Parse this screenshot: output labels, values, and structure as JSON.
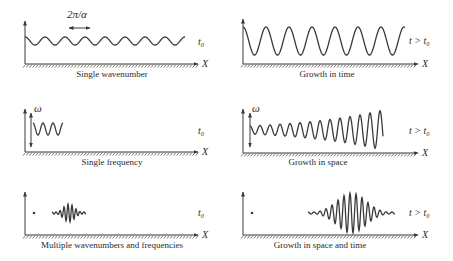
{
  "figure": {
    "panels": [
      {
        "id": "single-wavenumber",
        "caption": "Single wavenumber",
        "time_label": "t₀",
        "axis_label": "X",
        "annotation": "2π/α",
        "wave": {
          "type": "sinusoid",
          "x_start": 25,
          "x_end": 185,
          "center_y": 41,
          "amplitude": 4,
          "period": 20
        }
      },
      {
        "id": "growth-in-time",
        "caption": "Growth in time",
        "time_label": "t > t₀",
        "axis_label": "X",
        "wave": {
          "type": "sinusoid",
          "x_start": 243,
          "x_end": 405,
          "center_y": 41,
          "amplitude": 14,
          "period": 23
        }
      },
      {
        "id": "single-frequency",
        "caption": "Single frequency",
        "time_label": "t₀",
        "axis_label": "X",
        "annotation": "ω",
        "wave": {
          "type": "sinusoid",
          "x_start": 33,
          "x_end": 63,
          "center_y": 129,
          "amplitude": 6,
          "period": 10
        }
      },
      {
        "id": "growth-in-space",
        "caption": "Growth in space",
        "time_label": "t > t₀",
        "axis_label": "X",
        "annotation": "ω",
        "wave": {
          "type": "growing",
          "x_start": 250,
          "x_end": 383,
          "center_y": 130,
          "amplitude_start": 4,
          "amplitude_end": 20,
          "period": 10
        }
      },
      {
        "id": "multiple-wavenumbers",
        "caption": "Multiple wavenumbers and frequencies",
        "time_label": "t₀",
        "axis_label": "X",
        "wave": {
          "type": "packet",
          "x_start": 52,
          "x_end": 86,
          "center_y": 213,
          "amplitude": 9,
          "period": 4
        }
      },
      {
        "id": "growth-in-space-and-time",
        "caption": "Growth in space and time",
        "time_label": "t > t₀",
        "axis_label": "X",
        "wave": {
          "type": "packet",
          "x_start": 308,
          "x_end": 395,
          "center_y": 213,
          "amplitude": 20,
          "period": 6
        }
      }
    ]
  }
}
